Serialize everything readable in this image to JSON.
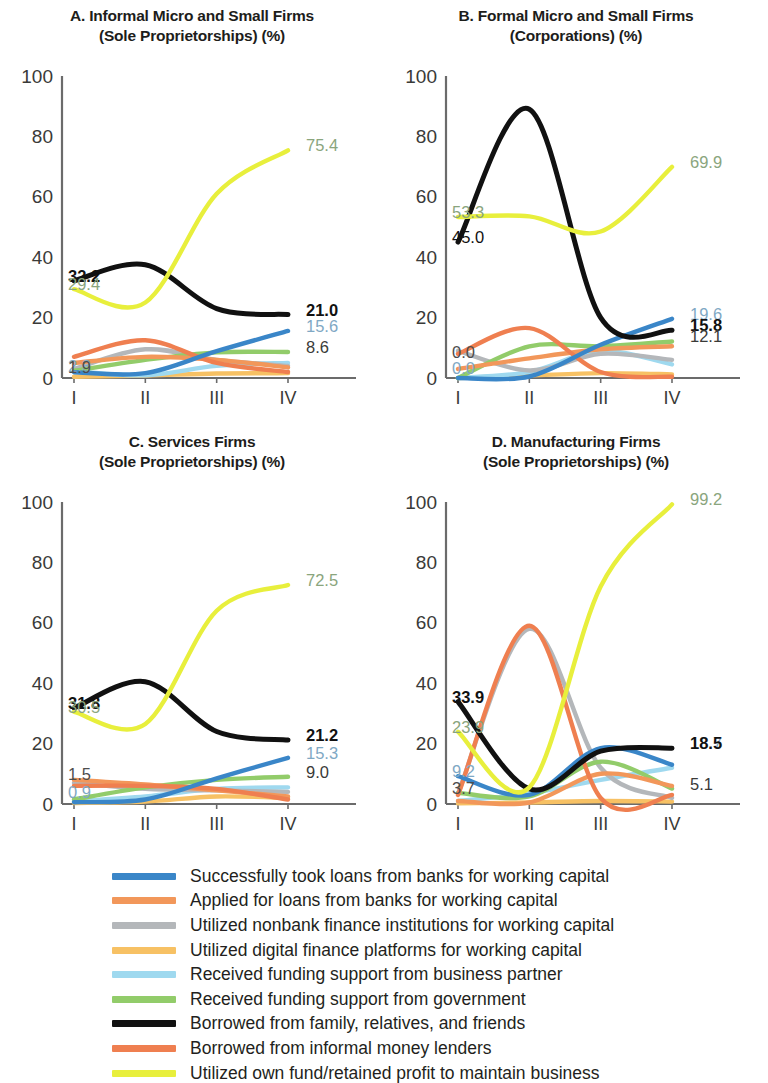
{
  "figure": {
    "panels": [
      {
        "id": "A",
        "title_line1": "A. Informal Micro and Small Firms",
        "title_line2": "(Sole Proprietorships) (%)"
      },
      {
        "id": "B",
        "title_line1": "B. Formal Micro and Small Firms",
        "title_line2": "(Corporations) (%)"
      },
      {
        "id": "C",
        "title_line1": "C. Services Firms",
        "title_line2": "(Sole Proprietorships) (%)"
      },
      {
        "id": "D",
        "title_line1": "D. Manufacturing Firms",
        "title_line2": "(Sole Proprietorships) (%)"
      }
    ]
  },
  "legend": {
    "items": [
      {
        "label": "Successfully took loans from banks for working capital",
        "color": "#3a86c8"
      },
      {
        "label": "Applied for loans from banks for working capital",
        "color": "#f2975a"
      },
      {
        "label": "Utilized nonbank finance institutions for working capital",
        "color": "#b4b7ba"
      },
      {
        "label": "Utilized digital finance platforms for working capital",
        "color": "#f7c164"
      },
      {
        "label": "Received funding support from business partner",
        "color": "#9fd9ef"
      },
      {
        "label": "Received funding support from government",
        "color": "#92cc6a"
      },
      {
        "label": "Borrowed from family, relatives, and friends",
        "color": "#111111"
      },
      {
        "label": "Borrowed from informal money lenders",
        "color": "#ef7f50"
      },
      {
        "label": "Utilized own fund/retained profit to maintain business",
        "color": "#e8ef3c"
      }
    ]
  },
  "chart_data": [
    {
      "panel": "A",
      "type": "line",
      "title": "A. Informal Micro and Small Firms (Sole Proprietorships) (%)",
      "xlabel": "",
      "ylabel": "",
      "x": [
        "I",
        "II",
        "III",
        "IV"
      ],
      "ticks": [
        "I",
        "II",
        "III",
        "IV"
      ],
      "yticks": [
        0,
        20,
        40,
        60,
        80,
        100
      ],
      "ylim": [
        0,
        100
      ],
      "grid": false,
      "legend_position": "bottom",
      "series": [
        {
          "name": "Successfully took loans from banks for working capital",
          "color": "#3a86c8",
          "values": [
            1.9,
            1.6,
            8.9,
            15.6
          ]
        },
        {
          "name": "Applied for loans from banks for working capital",
          "color": "#f2975a",
          "values": [
            5.0,
            7.0,
            6.0,
            3.5
          ]
        },
        {
          "name": "Utilized nonbank finance institutions for working capital",
          "color": "#b4b7ba",
          "values": [
            3.0,
            9.5,
            6.0,
            4.0
          ]
        },
        {
          "name": "Utilized digital finance platforms for working capital",
          "color": "#f7c164",
          "values": [
            0.4,
            0.8,
            1.5,
            1.6
          ]
        },
        {
          "name": "Received funding support from business partner",
          "color": "#9fd9ef",
          "values": [
            2.3,
            0.9,
            4.0,
            5.0
          ]
        },
        {
          "name": "Received funding support from government",
          "color": "#92cc6a",
          "values": [
            2.4,
            6.0,
            8.5,
            8.6
          ]
        },
        {
          "name": "Borrowed from family, relatives, and friends",
          "color": "#111111",
          "values": [
            32.2,
            37.5,
            23.0,
            21.0
          ]
        },
        {
          "name": "Borrowed from informal money lenders",
          "color": "#ef7f50",
          "values": [
            7.0,
            12.5,
            5.0,
            2.0
          ]
        },
        {
          "name": "Utilized own fund/retained profit to maintain business",
          "color": "#e8ef3c",
          "values": [
            29.4,
            25.0,
            61.0,
            75.4
          ]
        }
      ],
      "left_labels": [
        {
          "text": "32.2",
          "value": 32.2,
          "color": "#111111",
          "bold": true
        },
        {
          "text": "29.4",
          "value": 29.4,
          "color": "#8aa57d",
          "bold": false
        },
        {
          "text": "2.3",
          "value": 2.3,
          "color": "#7fa8c4",
          "bold": false
        },
        {
          "text": "1.9",
          "value": 1.9,
          "color": "#4d4d4d",
          "bold": false
        }
      ],
      "right_labels": [
        {
          "text": "75.4",
          "value": 75.4,
          "color": "#8aa57d",
          "bold": false
        },
        {
          "text": "21.0",
          "value": 21.0,
          "color": "#111111",
          "bold": true
        },
        {
          "text": "15.6",
          "value": 15.6,
          "color": "#7fa8c4",
          "bold": false
        },
        {
          "text": "8.6",
          "value": 8.6,
          "color": "#3a3a38",
          "bold": false
        }
      ]
    },
    {
      "panel": "B",
      "type": "line",
      "title": "B. Formal Micro and Small Firms (Corporations) (%)",
      "xlabel": "",
      "ylabel": "",
      "x": [
        "I",
        "II",
        "III",
        "IV"
      ],
      "ticks": [
        "I",
        "II",
        "III",
        "IV"
      ],
      "yticks": [
        0,
        20,
        40,
        60,
        80,
        100
      ],
      "ylim": [
        0,
        100
      ],
      "grid": false,
      "legend_position": "bottom",
      "series": [
        {
          "name": "Successfully took loans from banks for working capital",
          "color": "#3a86c8",
          "values": [
            0.0,
            0.5,
            11.0,
            19.6
          ]
        },
        {
          "name": "Applied for loans from banks for working capital",
          "color": "#f2975a",
          "values": [
            3.0,
            6.5,
            9.5,
            10.5
          ]
        },
        {
          "name": "Utilized nonbank finance institutions for working capital",
          "color": "#b4b7ba",
          "values": [
            9.0,
            2.5,
            8.0,
            6.0
          ]
        },
        {
          "name": "Utilized digital finance platforms for working capital",
          "color": "#f7c164",
          "values": [
            0.0,
            0.8,
            1.6,
            1.2
          ]
        },
        {
          "name": "Received funding support from business partner",
          "color": "#9fd9ef",
          "values": [
            0.0,
            2.0,
            9.0,
            4.5
          ]
        },
        {
          "name": "Received funding support from government",
          "color": "#92cc6a",
          "values": [
            0.0,
            10.5,
            10.5,
            12.1
          ]
        },
        {
          "name": "Borrowed from family, relatives, and friends",
          "color": "#111111",
          "values": [
            45.0,
            89.0,
            20.0,
            15.8
          ]
        },
        {
          "name": "Borrowed from informal money lenders",
          "color": "#ef7f50",
          "values": [
            8.0,
            16.5,
            2.0,
            0.4
          ]
        },
        {
          "name": "Utilized own fund/retained profit to maintain business",
          "color": "#e8ef3c",
          "values": [
            53.3,
            53.5,
            48.5,
            69.9
          ]
        }
      ],
      "left_labels": [
        {
          "text": "53.3",
          "value": 53.3,
          "color": "#8aa57d",
          "bold": false
        },
        {
          "text": "45.0",
          "value": 45.0,
          "color": "#111111",
          "bold": false
        },
        {
          "text": "0.0",
          "value": 7.0,
          "color": "#4d4d4d",
          "bold": false
        },
        {
          "text": "0.0",
          "value": 1.5,
          "color": "#7fa8c4",
          "bold": false
        }
      ],
      "right_labels": [
        {
          "text": "69.9",
          "value": 69.9,
          "color": "#8aa57d",
          "bold": false
        },
        {
          "text": "19.6",
          "value": 19.6,
          "color": "#7fa8c4",
          "bold": false
        },
        {
          "text": "15.8",
          "value": 15.8,
          "color": "#111111",
          "bold": true
        },
        {
          "text": "12.1",
          "value": 12.1,
          "color": "#3a3a38",
          "bold": false
        }
      ]
    },
    {
      "panel": "C",
      "type": "line",
      "title": "C. Services Firms (Sole Proprietorships) (%)",
      "xlabel": "",
      "ylabel": "",
      "x": [
        "I",
        "II",
        "III",
        "IV"
      ],
      "ticks": [
        "I",
        "II",
        "III",
        "IV"
      ],
      "yticks": [
        0,
        20,
        40,
        60,
        80,
        100
      ],
      "ylim": [
        0,
        100
      ],
      "grid": false,
      "legend_position": "bottom",
      "series": [
        {
          "name": "Successfully took loans from banks for working capital",
          "color": "#3a86c8",
          "values": [
            0.6,
            1.5,
            8.5,
            15.3
          ]
        },
        {
          "name": "Applied for loans from banks for working capital",
          "color": "#f2975a",
          "values": [
            8.0,
            6.5,
            4.5,
            2.5
          ]
        },
        {
          "name": "Utilized nonbank finance institutions for working capital",
          "color": "#b4b7ba",
          "values": [
            7.0,
            5.0,
            4.5,
            4.0
          ]
        },
        {
          "name": "Utilized digital finance platforms for working capital",
          "color": "#f7c164",
          "values": [
            0.3,
            0.8,
            2.5,
            2.0
          ]
        },
        {
          "name": "Received funding support from business partner",
          "color": "#9fd9ef",
          "values": [
            0.9,
            2.5,
            5.0,
            5.5
          ]
        },
        {
          "name": "Received funding support from government",
          "color": "#92cc6a",
          "values": [
            1.5,
            5.5,
            8.0,
            9.0
          ]
        },
        {
          "name": "Borrowed from family, relatives, and friends",
          "color": "#111111",
          "values": [
            31.8,
            40.5,
            24.0,
            21.2
          ]
        },
        {
          "name": "Borrowed from informal money lenders",
          "color": "#ef7f50",
          "values": [
            6.0,
            6.0,
            5.0,
            1.5
          ]
        },
        {
          "name": "Utilized own fund/retained profit to maintain business",
          "color": "#e8ef3c",
          "values": [
            30.5,
            26.5,
            64.0,
            72.5
          ]
        }
      ],
      "left_labels": [
        {
          "text": "31.8",
          "value": 31.8,
          "color": "#111111",
          "bold": true
        },
        {
          "text": "30.5",
          "value": 30.5,
          "color": "#8aa57d",
          "bold": false
        },
        {
          "text": "1.5",
          "value": 8.2,
          "color": "#4d4d4d",
          "bold": false
        },
        {
          "text": "0.9",
          "value": 2.2,
          "color": "#7fa8c4",
          "bold": false
        }
      ],
      "right_labels": [
        {
          "text": "72.5",
          "value": 72.5,
          "color": "#8aa57d",
          "bold": false
        },
        {
          "text": "21.2",
          "value": 21.2,
          "color": "#111111",
          "bold": true
        },
        {
          "text": "15.3",
          "value": 15.3,
          "color": "#7fa8c4",
          "bold": false
        },
        {
          "text": "9.0",
          "value": 9.0,
          "color": "#3a3a38",
          "bold": false
        }
      ]
    },
    {
      "panel": "D",
      "type": "line",
      "title": "D. Manufacturing Firms (Sole Proprietorships) (%)",
      "xlabel": "",
      "ylabel": "",
      "x": [
        "I",
        "II",
        "III",
        "IV"
      ],
      "ticks": [
        "I",
        "II",
        "III",
        "IV"
      ],
      "yticks": [
        0,
        20,
        40,
        60,
        80,
        100
      ],
      "ylim": [
        0,
        100
      ],
      "grid": false,
      "legend_position": "bottom",
      "series": [
        {
          "name": "Successfully took loans from banks for working capital",
          "color": "#3a86c8",
          "values": [
            9.2,
            3.0,
            18.5,
            13.0
          ]
        },
        {
          "name": "Applied for loans from banks for working capital",
          "color": "#f2975a",
          "values": [
            1.0,
            0.5,
            10.0,
            6.0
          ]
        },
        {
          "name": "Utilized nonbank finance institutions for working capital",
          "color": "#b4b7ba",
          "values": [
            3.5,
            58.0,
            12.0,
            2.0
          ]
        },
        {
          "name": "Utilized digital finance platforms for working capital",
          "color": "#f7c164",
          "values": [
            0.2,
            0.5,
            1.0,
            0.8
          ]
        },
        {
          "name": "Received funding support from business partner",
          "color": "#9fd9ef",
          "values": [
            1.0,
            3.5,
            8.0,
            12.0
          ]
        },
        {
          "name": "Received funding support from government",
          "color": "#92cc6a",
          "values": [
            3.7,
            2.5,
            14.0,
            5.1
          ]
        },
        {
          "name": "Borrowed from family, relatives, and friends",
          "color": "#111111",
          "values": [
            33.9,
            5.0,
            17.5,
            18.5
          ]
        },
        {
          "name": "Borrowed from informal money lenders",
          "color": "#ef7f50",
          "values": [
            3.0,
            59.0,
            2.0,
            3.0
          ]
        },
        {
          "name": "Utilized own fund/retained profit to maintain business",
          "color": "#e8ef3c",
          "values": [
            23.9,
            5.5,
            72.0,
            99.2
          ]
        }
      ],
      "left_labels": [
        {
          "text": "33.9",
          "value": 33.9,
          "color": "#111111",
          "bold": true
        },
        {
          "text": "23.9",
          "value": 23.9,
          "color": "#8aa57d",
          "bold": false
        },
        {
          "text": "9.2",
          "value": 9.2,
          "color": "#7fa8c4",
          "bold": false
        },
        {
          "text": "3.7",
          "value": 3.7,
          "color": "#4d4d4d",
          "bold": false
        }
      ],
      "right_labels": [
        {
          "text": "99.2",
          "value": 99.2,
          "color": "#8aa57d",
          "bold": false
        },
        {
          "text": "18.7",
          "value": 18.7,
          "color": "#7fa8c4",
          "bold": false
        },
        {
          "text": "18.5",
          "value": 18.5,
          "color": "#111111",
          "bold": true
        },
        {
          "text": "5.1",
          "value": 5.1,
          "color": "#3a3a38",
          "bold": false
        }
      ]
    }
  ]
}
